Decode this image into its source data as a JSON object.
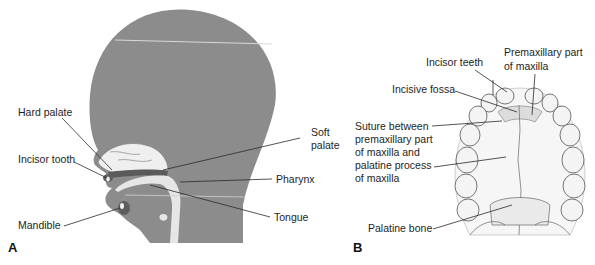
{
  "figure": {
    "panels": [
      {
        "id": "A",
        "label": "A",
        "title": "Sagittal view of infant head",
        "labels": {
          "hard_palate": "Hard palate",
          "incisor_tooth": "Incisor tooth",
          "mandible": "Mandible",
          "soft_palate_1": "Soft",
          "soft_palate_2": "palate",
          "pharynx": "Pharynx",
          "tongue": "Tongue"
        }
      },
      {
        "id": "B",
        "label": "B",
        "title": "Inferior view of palate",
        "labels": {
          "incisor_teeth": "Incisor teeth",
          "premaxillary_1": "Premaxillary part",
          "premaxillary_2": "of maxilla",
          "incisive_fossa": "Incisive fossa",
          "suture_1": "Suture between",
          "suture_2": "premaxillary part",
          "suture_3": "of maxilla and",
          "suture_4": "palatine process",
          "suture_5": "of maxilla",
          "palatine_bone": "Palatine bone"
        }
      }
    ],
    "colors": {
      "head_fill": "#8c8c8c",
      "airway_fill": "#e6e6e6",
      "palate_dark": "#5a5a5a",
      "leader_line": "#2a2a2a",
      "tooth_fill": "#f4f4f4",
      "tooth_stroke": "#555555"
    }
  }
}
